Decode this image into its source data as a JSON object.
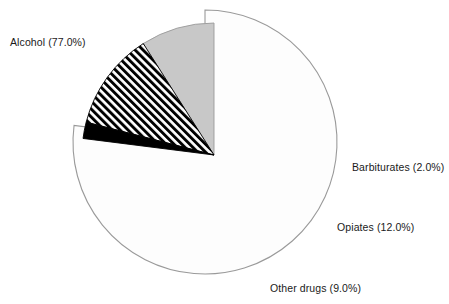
{
  "chart_data": {
    "type": "pie",
    "title": "",
    "subtitle": "",
    "xlabel": "",
    "ylabel": "",
    "legend_position": "none",
    "grid": false,
    "start_angle_deg": 0,
    "direction": "clockwise",
    "categories": [
      "Alcohol",
      "Barbiturates",
      "Opiates",
      "Other drugs"
    ],
    "values": [
      77.0,
      2.0,
      12.0,
      9.0
    ],
    "units": "percent",
    "labels": [
      "Alcohol (77.0%)",
      "Barbiturates (2.0%)",
      "Opiates (12.0%)",
      "Other drugs (9.0%)"
    ],
    "slices": [
      {
        "name": "Alcohol",
        "value": 77.0,
        "label": "Alcohol (77.0%)",
        "fill": "#fdfdfd",
        "fill_style": "solid",
        "stroke": "#9a9a9a",
        "exploded": false,
        "label_position": "left"
      },
      {
        "name": "Barbiturates",
        "value": 2.0,
        "label": "Barbiturates (2.0%)",
        "fill": "#000000",
        "fill_style": "solid",
        "stroke": "#000000",
        "exploded": true,
        "label_position": "right"
      },
      {
        "name": "Opiates",
        "value": 12.0,
        "label": "Opiates (12.0%)",
        "fill": "#ffffff",
        "fill_style": "diagonal-hatch",
        "stroke": "#000000",
        "exploded": true,
        "label_position": "right"
      },
      {
        "name": "Other drugs",
        "value": 9.0,
        "label": "Other drugs (9.0%)",
        "fill": "#c8c8c8",
        "fill_style": "solid",
        "stroke": "#9a9a9a",
        "exploded": true,
        "label_position": "bottom-right"
      }
    ],
    "colors": {
      "alcohol": "#fdfdfd",
      "barbiturates": "#000000",
      "opiates": "#ffffff",
      "other_drugs": "#c8c8c8",
      "outline": "#9a9a9a",
      "text": "#1a1a1a",
      "background": "#ffffff"
    }
  }
}
